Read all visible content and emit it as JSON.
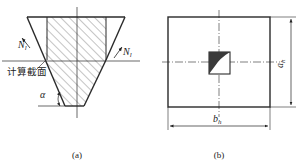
{
  "figure_a": {
    "caption": "(a)",
    "section_label": "计算截面",
    "force_left": {
      "symbol": "N",
      "subscript": "l"
    },
    "force_right": {
      "symbol": "N",
      "subscript": "l"
    },
    "angle_label": "α"
  },
  "figure_b": {
    "caption": "(b)",
    "dim_vertical": {
      "symbol": "a",
      "subscript": "h"
    },
    "dim_horizontal": {
      "symbol": "b",
      "subscript": "h"
    }
  },
  "colors": {
    "line": "#2a2a2a",
    "hatch": "#555555",
    "fill_dark": "#3a3a3a",
    "background": "#ffffff"
  }
}
